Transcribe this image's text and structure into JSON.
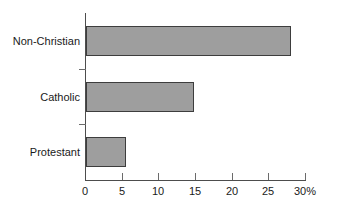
{
  "chart_data": {
    "type": "bar",
    "orientation": "horizontal",
    "title": "",
    "subtitle": "",
    "xlabel": "",
    "ylabel": "",
    "categories": [
      "Protestant",
      "Catholic",
      "Non-Christian"
    ],
    "values": [
      5.4,
      14.7,
      28.0
    ],
    "series": [
      {
        "name": "Percent",
        "values": [
          5.4,
          14.7,
          28.0
        ]
      }
    ],
    "xlim": [
      0,
      30
    ],
    "ylim": [
      0,
      3
    ],
    "x_ticks": [
      0,
      5,
      10,
      15,
      20,
      25,
      30
    ],
    "x_tick_labels": [
      "0",
      "5",
      "10",
      "15",
      "20",
      "25",
      "30%"
    ],
    "value_unit": "%",
    "grid": false,
    "legend": false,
    "legend_position": "none",
    "annotations": [],
    "bar_fill_color": "#9e9e9e",
    "bar_edge_color": "#3d3d3d",
    "axis_color": "#4d4d4d",
    "background_color": "#ffffff"
  },
  "bars": [
    {
      "label": "Non-Christian",
      "value": 28.0
    },
    {
      "label": "Catholic",
      "value": 14.7
    },
    {
      "label": "Protestant",
      "value": 5.4
    }
  ],
  "x_axis": {
    "ticks": [
      {
        "value": 0,
        "label": "0"
      },
      {
        "value": 5,
        "label": "5"
      },
      {
        "value": 10,
        "label": "10"
      },
      {
        "value": 15,
        "label": "15"
      },
      {
        "value": 20,
        "label": "20"
      },
      {
        "value": 25,
        "label": "25"
      },
      {
        "value": 30,
        "label": "30%"
      }
    ]
  }
}
